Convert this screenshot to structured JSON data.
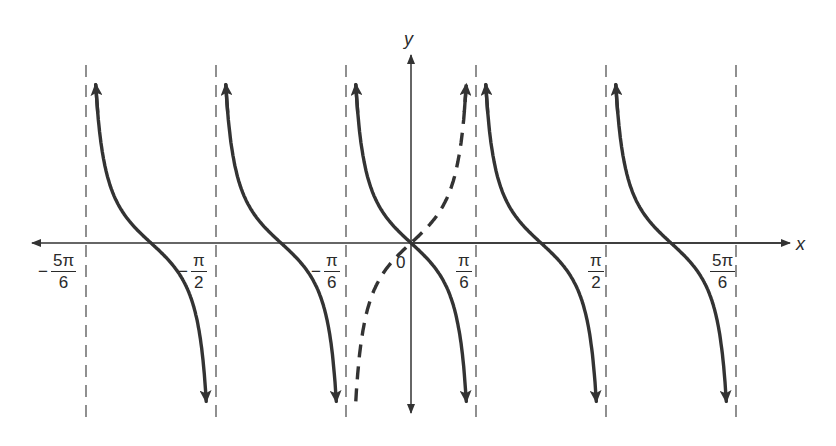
{
  "chart_data": {
    "type": "line",
    "title": "",
    "xlabel": "x",
    "ylabel": "y",
    "origin_label": "0",
    "x_ticks": [
      {
        "value": "-5π/6",
        "sign": "−",
        "num": "5π",
        "den": "6"
      },
      {
        "value": "-π/2",
        "sign": "−",
        "num": "π",
        "den": "2"
      },
      {
        "value": "-π/6",
        "sign": "−",
        "num": "π",
        "den": "6"
      },
      {
        "value": "π/6",
        "sign": "",
        "num": "π",
        "den": "6"
      },
      {
        "value": "π/2",
        "sign": "",
        "num": "π",
        "den": "2"
      },
      {
        "value": "5π/6",
        "sign": "",
        "num": "5π",
        "den": "6"
      }
    ],
    "asymptotes": [
      "-5π/6",
      "-π/2",
      "-π/6",
      "π/6",
      "π/2",
      "5π/6"
    ],
    "series": [
      {
        "name": "y = -tan(3x)",
        "style": "solid",
        "branches": [
          {
            "from": "-5π/6",
            "to": "-π/2",
            "zero": "-2π/3"
          },
          {
            "from": "-π/2",
            "to": "-π/6",
            "zero": "-π/3"
          },
          {
            "from": "-π/6",
            "to": "π/6",
            "zero": "0"
          },
          {
            "from": "π/6",
            "to": "π/2",
            "zero": "π/3"
          },
          {
            "from": "π/2",
            "to": "5π/6",
            "zero": "2π/3"
          }
        ]
      },
      {
        "name": "y = tan(3x)",
        "style": "dashed",
        "branches": [
          {
            "from": "-π/6",
            "to": "π/6",
            "zero": "0"
          }
        ]
      }
    ],
    "grid": false,
    "legend": null
  },
  "colors": {
    "curve": "#333333",
    "axis": "#333333",
    "asymptote": "#555555",
    "background": "#ffffff"
  }
}
